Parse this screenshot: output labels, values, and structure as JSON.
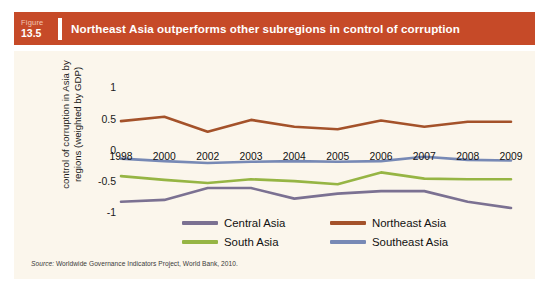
{
  "figure": {
    "word_label": "Figure",
    "number": "13.5",
    "title": "Northeast Asia outperforms other subregions in control of corruption",
    "banner_color": "#c64a28",
    "card_background": "#fbf6ec"
  },
  "source": {
    "prefix": "Source:",
    "text": " Worldwide Governance Indicators Project, World Bank, 2010."
  },
  "legend": {
    "position": "bottom",
    "entries": [
      {
        "label": "Central Asia",
        "color": "#7b7192"
      },
      {
        "label": "Northeast Asia",
        "color": "#a4522a"
      },
      {
        "label": "South Asia",
        "color": "#96b544"
      },
      {
        "label": "Southeast Asia",
        "color": "#7789b5"
      }
    ]
  },
  "chart_data": {
    "type": "line",
    "title": "Northeast Asia outperforms other subregions in control of corruption",
    "xlabel": "",
    "ylabel": "control of corruption in Asia by regions (weighted by GDP)",
    "ylim": [
      -1.25,
      1.15
    ],
    "yticks": [
      1,
      0.5,
      0,
      -0.5,
      -1
    ],
    "ytick_labels": [
      "1",
      "0.5",
      "0",
      "-0.5",
      "-1"
    ],
    "grid": false,
    "categories": [
      "1998",
      "2000",
      "2002",
      "2003",
      "2004",
      "2005",
      "2006",
      "2007",
      "2008",
      "2009"
    ],
    "series": [
      {
        "name": "Central Asia",
        "color": "#7b7192",
        "values": [
          -0.83,
          -0.8,
          -0.61,
          -0.61,
          -0.78,
          -0.7,
          -0.66,
          -0.66,
          -0.83,
          -0.93
        ]
      },
      {
        "name": "Northeast Asia",
        "color": "#a4522a",
        "values": [
          0.46,
          0.53,
          0.29,
          0.48,
          0.37,
          0.33,
          0.47,
          0.37,
          0.45,
          0.45
        ]
      },
      {
        "name": "South Asia",
        "color": "#96b544",
        "values": [
          -0.42,
          -0.48,
          -0.53,
          -0.47,
          -0.5,
          -0.55,
          -0.36,
          -0.46,
          -0.47,
          -0.47
        ]
      },
      {
        "name": "Southeast Asia",
        "color": "#7789b5",
        "values": [
          -0.14,
          -0.18,
          -0.21,
          -0.19,
          -0.18,
          -0.19,
          -0.18,
          -0.11,
          -0.16,
          -0.17
        ]
      }
    ]
  }
}
